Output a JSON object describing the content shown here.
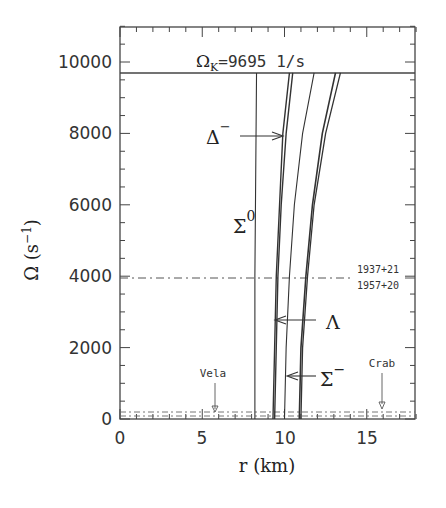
{
  "chart_data": {
    "type": "line",
    "title": "",
    "xlabel": "r (km)",
    "ylabel": "Ω (s⁻¹)",
    "xlim": [
      0,
      18
    ],
    "ylim": [
      0,
      11000
    ],
    "x_ticks": [
      "0",
      "5",
      "10",
      "15"
    ],
    "y_ticks": [
      "0",
      "2000",
      "4000",
      "6000",
      "8000",
      "10000"
    ],
    "grid": false,
    "legend": null,
    "reference_lines": [
      {
        "name": "Kepler frequency",
        "label": "Ω_K=9695 1/s",
        "y": 9695,
        "style": "solid"
      },
      {
        "name": "1937+21 / 1957+20",
        "label_top": "1937+21",
        "label_bottom": "1957+20",
        "y": 3900,
        "style": "dash-dot"
      },
      {
        "name": "Vela",
        "label": "Vela",
        "y": 70,
        "style": "dash-dot",
        "marker_x": 6.0
      },
      {
        "name": "Crab",
        "label": "Crab",
        "y": 190,
        "style": "dash-dot",
        "marker_x": 16.0
      }
    ],
    "series": [
      {
        "name": "Σ0 (vertical)",
        "points": [
          [
            8.2,
            0
          ],
          [
            8.2,
            4000
          ],
          [
            8.3,
            9695
          ]
        ]
      },
      {
        "name": "Δ− / Λ inner",
        "points": [
          [
            9.3,
            0
          ],
          [
            9.4,
            2000
          ],
          [
            9.5,
            4000
          ],
          [
            9.7,
            6000
          ],
          [
            9.9,
            8000
          ],
          [
            10.3,
            9695
          ]
        ]
      },
      {
        "name": "Δ− / Λ outer",
        "points": [
          [
            9.4,
            0
          ],
          [
            9.5,
            2000
          ],
          [
            9.6,
            4000
          ],
          [
            9.8,
            6000
          ],
          [
            10.1,
            8000
          ],
          [
            10.5,
            9695
          ]
        ]
      },
      {
        "name": "Σ−",
        "points": [
          [
            10.0,
            0
          ],
          [
            10.1,
            2000
          ],
          [
            10.3,
            4000
          ],
          [
            10.6,
            6000
          ],
          [
            11.1,
            8000
          ],
          [
            11.8,
            9695
          ]
        ]
      },
      {
        "name": "outer pair 1",
        "points": [
          [
            10.9,
            0
          ],
          [
            11.0,
            2000
          ],
          [
            11.3,
            4000
          ],
          [
            11.7,
            6000
          ],
          [
            12.3,
            8000
          ],
          [
            13.1,
            9695
          ]
        ]
      },
      {
        "name": "outer pair 2",
        "points": [
          [
            11.0,
            0
          ],
          [
            11.1,
            2000
          ],
          [
            11.4,
            4000
          ],
          [
            11.8,
            6000
          ],
          [
            12.5,
            8000
          ],
          [
            13.4,
            9695
          ]
        ]
      }
    ],
    "annotations": [
      {
        "text": "Δ⁻",
        "arrow_to_r": 10.0,
        "at_omega": 7900
      },
      {
        "text": "Σ⁰",
        "at_r": 7.0,
        "at_omega": 5300
      },
      {
        "text": "Λ",
        "arrow_to_r": 9.5,
        "at_omega": 2800
      },
      {
        "text": "Σ⁻",
        "arrow_to_r": 10.2,
        "at_omega": 1200
      }
    ]
  },
  "labels": {
    "kepler_omega": "Ω",
    "kepler_sub": "K",
    "kepler_value": "=9695  1/s",
    "pulsar_top": "1937+21",
    "pulsar_bottom": "1957+20",
    "vela": "Vela",
    "crab": "Crab",
    "delta": "Δ",
    "delta_sup": "−",
    "sigma0": "Σ",
    "sigma0_sup": "0",
    "lambda": "Λ",
    "sigma_minus": "Σ",
    "sigma_minus_sup": "−",
    "xlabel": "r  (km)",
    "ylabel": "Ω  (s",
    "ylabel_sup": "−1",
    "ylabel_close": ")"
  },
  "ticks": {
    "x": [
      "0",
      "5",
      "10",
      "15"
    ],
    "y": [
      "0",
      "2000",
      "4000",
      "6000",
      "8000",
      "10000"
    ]
  }
}
